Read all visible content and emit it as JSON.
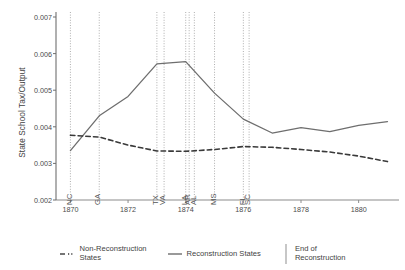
{
  "chart_data": {
    "type": "line",
    "title": "",
    "xlabel": "",
    "ylabel": "State School Tax/Output",
    "xlim": [
      1869.5,
      1881.4
    ],
    "ylim": [
      0.002,
      0.007
    ],
    "grid": false,
    "legend_position": "bottom",
    "xticks": [
      1870,
      1872,
      1874,
      1876,
      1878,
      1880
    ],
    "xtick_labels": [
      "1870",
      "1872",
      "1874",
      "1876",
      "1878",
      "1880"
    ],
    "yticks": [
      0.002,
      0.003,
      0.004,
      0.005,
      0.006,
      0.007
    ],
    "ytick_labels": [
      "0.002",
      "0.003",
      "0.004",
      "0.005",
      "0.006",
      "0.007"
    ],
    "x": [
      1870,
      1871,
      1872,
      1873,
      1874,
      1875,
      1876,
      1877,
      1878,
      1879,
      1880,
      1881
    ],
    "series": [
      {
        "name": "Reconstruction States",
        "style": "solid",
        "color": "#6e6e6e",
        "values": [
          0.00335,
          0.0043,
          0.00483,
          0.00572,
          0.00578,
          0.00492,
          0.00421,
          0.00383,
          0.00398,
          0.00387,
          0.00404,
          0.00414
        ]
      },
      {
        "name": "Non-Reconstruction States",
        "style": "dashed",
        "color": "#3a3a3a",
        "values": [
          0.00377,
          0.00372,
          0.0035,
          0.00334,
          0.00333,
          0.00338,
          0.00346,
          0.00344,
          0.00338,
          0.00331,
          0.0032,
          0.00305
        ]
      }
    ],
    "vlines": [
      {
        "year": 1870.0,
        "labels": "NC"
      },
      {
        "year": 1871.0,
        "labels": "GA"
      },
      {
        "year": 1873.0,
        "labels": "TX"
      },
      {
        "year": 1873.25,
        "labels": "VA"
      },
      {
        "year": 1874.0,
        "labels": "LA"
      },
      {
        "year": 1874.12,
        "labels": "AR"
      },
      {
        "year": 1874.3,
        "labels": "AL"
      },
      {
        "year": 1875.0,
        "labels": "MS"
      },
      {
        "year": 1876.0,
        "labels": "FL"
      },
      {
        "year": 1876.2,
        "labels": "SC"
      }
    ],
    "vline_color": "#9a9a9a",
    "annotations": [
      "NC",
      "GA",
      "TX",
      "VA",
      "LA",
      "AR",
      "AL",
      "MS",
      "FL",
      "SC"
    ]
  },
  "legend": {
    "entries": [
      {
        "label_line1": "Non-Reconstruction",
        "label_line2": "States",
        "marker": "dashed-line"
      },
      {
        "label_line1": "Reconstruction States",
        "label_line2": "",
        "marker": "solid-line"
      },
      {
        "label_line1": "End of",
        "label_line2": "Reconstruction",
        "marker": "vertical-rule"
      }
    ]
  }
}
